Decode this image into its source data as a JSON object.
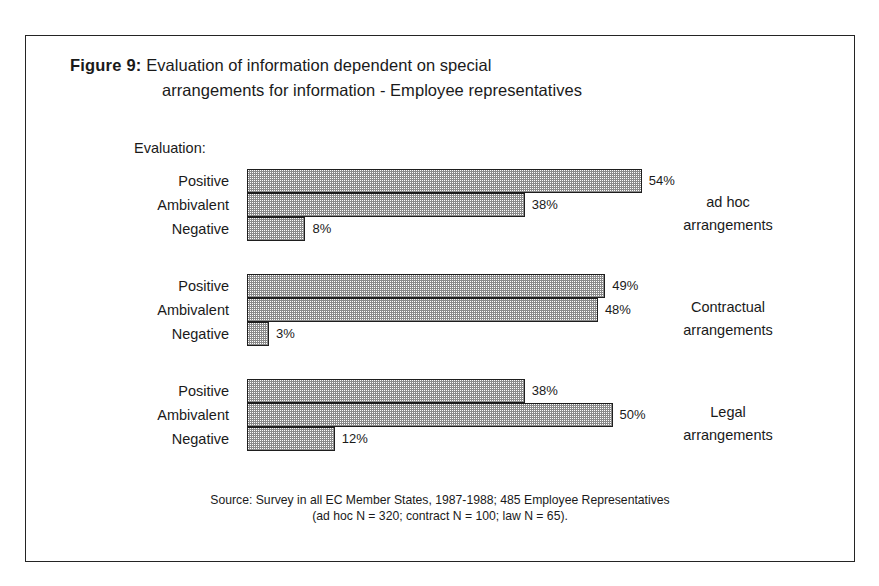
{
  "figure": {
    "label": "Figure 9:",
    "title_line_1": "Evaluation of information dependent on special",
    "title_line_2": "arrangements for information - Employee representatives",
    "evaluation_caption": "Evaluation:"
  },
  "source": {
    "line_1": "Source: Survey in all EC Member States, 1987-1988; 485 Employee Representatives",
    "line_2": "(ad hoc N = 320; contract N = 100; law N = 65)."
  },
  "colors": {
    "frame": "#242424",
    "bar_outline": "#1e1e1e",
    "bar_fill_pattern": "#8a8a8a",
    "text": "#1a1a1a",
    "background": "#ffffff"
  },
  "chart_data": {
    "type": "bar",
    "orientation": "horizontal",
    "title": "Figure 9: Evaluation of information dependent on special arrangements for information - Employee representatives",
    "subtitle": "Evaluation:",
    "xlabel": "",
    "ylabel": "",
    "xlim": [
      0,
      60
    ],
    "grid": false,
    "legend": "none",
    "value_suffix": "%",
    "categories": [
      "Positive",
      "Ambivalent",
      "Negative"
    ],
    "series": [
      {
        "name": "ad hoc arrangements",
        "values": [
          54,
          38,
          8
        ]
      },
      {
        "name": "Contractual arrangements",
        "values": [
          49,
          48,
          3
        ]
      },
      {
        "name": "Legal arrangements",
        "values": [
          38,
          50,
          12
        ]
      }
    ],
    "annotations": [
      "Source: Survey in all EC Member States, 1987-1988; 485 Employee Representatives",
      "(ad hoc N = 320; contract N = 100; law N = 65)."
    ]
  },
  "groups": [
    {
      "label_line_1": "ad hoc",
      "label_line_2": "arrangements",
      "bars": [
        {
          "category": "Positive",
          "value": 54,
          "value_label": "54%"
        },
        {
          "category": "Ambivalent",
          "value": 38,
          "value_label": "38%"
        },
        {
          "category": "Negative",
          "value": 8,
          "value_label": "8%"
        }
      ]
    },
    {
      "label_line_1": "Contractual",
      "label_line_2": "arrangements",
      "bars": [
        {
          "category": "Positive",
          "value": 49,
          "value_label": "49%"
        },
        {
          "category": "Ambivalent",
          "value": 48,
          "value_label": "48%"
        },
        {
          "category": "Negative",
          "value": 3,
          "value_label": "3%"
        }
      ]
    },
    {
      "label_line_1": "Legal",
      "label_line_2": "arrangements",
      "bars": [
        {
          "category": "Positive",
          "value": 38,
          "value_label": "38%"
        },
        {
          "category": "Ambivalent",
          "value": 50,
          "value_label": "50%"
        },
        {
          "category": "Negative",
          "value": 12,
          "value_label": "12%"
        }
      ]
    }
  ],
  "scale": {
    "px_per_percent": 7.31
  }
}
